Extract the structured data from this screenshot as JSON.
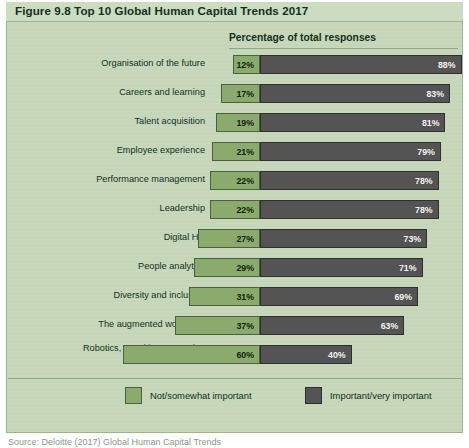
{
  "figure": {
    "title": "Figure 9.8  Top 10 Global Human Capital Trends 2017",
    "axis_header": "Percentage of total responses",
    "source": "Source: Deloitte (2017) Global Human Capital Trends"
  },
  "legend": {
    "items": [
      {
        "label": "Not/somewhat important",
        "color": "#8aab6d",
        "swatch": "green"
      },
      {
        "label": "Important/very important",
        "color": "#545454",
        "swatch": "grey"
      }
    ]
  },
  "colors": {
    "panel_background": "#c6d8b9",
    "title_background": "#ccdcc0",
    "left_series": "#8aab6d",
    "right_series": "#545454",
    "rule": "#8fa87f",
    "text": "#142f1c"
  },
  "chart_data": {
    "type": "bar",
    "title": "Top 10 Global Human Capital Trends 2017",
    "subtitle": "Percentage of total responses",
    "xlabel": "Percentage of total responses",
    "ylabel": "",
    "xlim": [
      0,
      100
    ],
    "grid": false,
    "stacked": true,
    "orientation": "horizontal",
    "legend_position": "bottom",
    "categories": [
      "Organisation of the future",
      "Careers and learning",
      "Talent acquisition",
      "Employee experience",
      "Performance  management",
      "Leadership",
      "Digital HR",
      "People analytics",
      "Diversity and inclusion",
      "The  augmented workforce",
      "Robotics, cognitive computing\nand AI"
    ],
    "series": [
      {
        "name": "Not/somewhat important",
        "color": "#8aab6d",
        "values": [
          12,
          17,
          19,
          21,
          22,
          22,
          27,
          29,
          31,
          37,
          60
        ],
        "labels": [
          "12%",
          "17%",
          "19%",
          "21%",
          "22%",
          "22%",
          "27%",
          "29%",
          "31%",
          "37%",
          "60%"
        ]
      },
      {
        "name": "Important/very important",
        "color": "#545454",
        "values": [
          88,
          83,
          81,
          79,
          78,
          78,
          73,
          71,
          69,
          63,
          40
        ],
        "labels": [
          "88%",
          "83%",
          "81%",
          "79%",
          "78%",
          "78%",
          "73%",
          "71%",
          "69%",
          "63%",
          "40%"
        ]
      }
    ]
  }
}
